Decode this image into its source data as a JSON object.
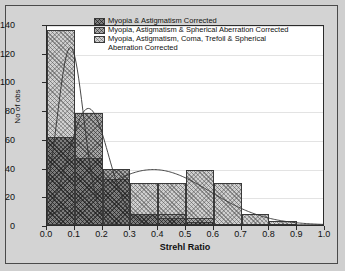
{
  "chart_data": {
    "type": "bar",
    "title": "",
    "xlabel": "Strehl Ratio",
    "ylabel": "No of obs",
    "xlim": [
      0.0,
      1.0
    ],
    "ylim": [
      0,
      140
    ],
    "grid": true,
    "legend_position": "top-center",
    "xticks": [
      "0.0",
      "0.1",
      "0.2",
      "0.3",
      "0.4",
      "0.5",
      "0.6",
      "0.7",
      "0.8",
      "0.9",
      "1.0"
    ],
    "xtick_values": [
      0.0,
      0.1,
      0.2,
      0.3,
      0.4,
      0.5,
      0.6,
      0.7,
      0.8,
      0.9,
      1.0
    ],
    "yticks": [
      "0",
      "20",
      "40",
      "60",
      "80",
      "100",
      "120",
      "140"
    ],
    "ytick_values": [
      0,
      20,
      40,
      60,
      80,
      100,
      120,
      140
    ],
    "bin_edges": [
      0.0,
      0.1,
      0.2,
      0.3,
      0.4,
      0.5,
      0.6,
      0.7,
      0.8,
      0.9,
      1.0
    ],
    "categories": [
      "0.0-0.1",
      "0.1-0.2",
      "0.2-0.3",
      "0.3-0.4",
      "0.4-0.5",
      "0.5-0.6",
      "0.6-0.7",
      "0.7-0.8",
      "0.8-0.9",
      "0.9-1.0"
    ],
    "series": [
      {
        "name": "Myopia & Astigmatism Corrected",
        "style": "dark-cross-hatch",
        "color": "#7d7d7d",
        "values": [
          61,
          47,
          32,
          8,
          5,
          2,
          0,
          0,
          0,
          0
        ]
      },
      {
        "name": "Myopia, Astigmatism & Spherical Aberration Corrected",
        "style": "medium-cross-hatch",
        "color": "#a6a6a6",
        "values": [
          61,
          78,
          39,
          8,
          8,
          5,
          0,
          0,
          0,
          0
        ]
      },
      {
        "name": "Myopia, Astigmatism, Coma, Trefoil & Spherical Aberration Corrected",
        "style": "light-cross-hatch",
        "color": "#d0d0d0",
        "values": [
          136,
          78,
          39,
          29,
          29,
          38,
          29,
          8,
          3,
          0
        ]
      }
    ],
    "fit_curves": [
      {
        "for_series": "Myopia & Astigmatism Corrected",
        "type": "normal-fit",
        "peak_x": 0.085,
        "peak_y": 125
      },
      {
        "for_series": "Myopia, Astigmatism & Spherical Aberration Corrected",
        "type": "normal-fit",
        "peak_x": 0.15,
        "peak_y": 82
      },
      {
        "for_series": "Myopia, Astigmatism, Coma, Trefoil & Spherical Aberration Corrected",
        "type": "normal-fit",
        "peak_x": 0.385,
        "peak_y": 39
      }
    ]
  },
  "legend": {
    "entries": [
      "Myopia & Astigmatism Corrected",
      "Myopia, Astigmatism & Spherical Aberration Corrected",
      "Myopia, Astigmatism, Coma, Trefoil & Spherical\nAberration Corrected"
    ]
  }
}
